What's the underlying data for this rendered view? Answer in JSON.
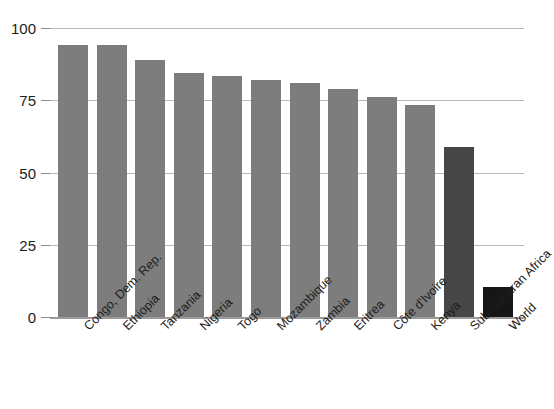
{
  "chart_data": {
    "type": "bar",
    "title": "",
    "subtitle": "",
    "xlabel": "",
    "ylabel": "",
    "ylim": [
      0,
      100
    ],
    "yticks": [
      0,
      25,
      50,
      75,
      100
    ],
    "ytick_labels": [
      "0",
      "25",
      "50",
      "75",
      "100"
    ],
    "grid": true,
    "legend": "none",
    "categories": [
      "Congo, Dem. Rep.",
      "Ethiopia",
      "Tanzania",
      "Nigeria",
      "Togo",
      "Mozambique",
      "Zambia",
      "Eritrea",
      "Côte d'Ivoire",
      "Kenya",
      "Sub-Saharan Africa",
      "World"
    ],
    "values": [
      94,
      94,
      89,
      84.5,
      83.5,
      82,
      81,
      79,
      76,
      73.5,
      59,
      10.5
    ],
    "bar_colors": [
      "#7d7d7d",
      "#7d7d7d",
      "#7d7d7d",
      "#7d7d7d",
      "#7d7d7d",
      "#7d7d7d",
      "#7d7d7d",
      "#7d7d7d",
      "#7d7d7d",
      "#7d7d7d",
      "#464646",
      "#161616"
    ],
    "colors": {
      "country_bar": "#7d7d7d",
      "region_bar": "#464646",
      "world_bar": "#161616",
      "gridline": "#b9b9b9",
      "axis_text": "#1d1d1d",
      "background": "#ffffff"
    }
  }
}
